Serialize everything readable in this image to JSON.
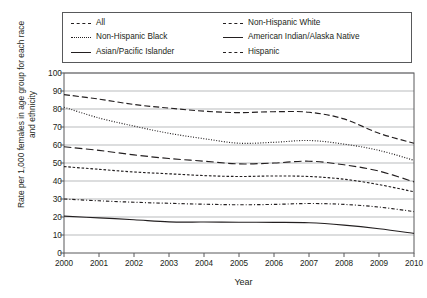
{
  "chart_data": {
    "type": "line",
    "title": "",
    "xlabel": "Year",
    "ylabel": "Rate per 1,000 females in age group for each race and ethnicity",
    "x": [
      2000,
      2001,
      2002,
      2003,
      2004,
      2005,
      2006,
      2007,
      2008,
      2009,
      2010
    ],
    "xlim": [
      2000,
      2010
    ],
    "ylim": [
      0,
      100
    ],
    "yticks": [
      0,
      10,
      20,
      30,
      40,
      50,
      60,
      70,
      80,
      90,
      100
    ],
    "xticks": [
      "2000",
      "2001",
      "2002",
      "2003",
      "2004",
      "2005",
      "2006",
      "2007",
      "2008",
      "2009",
      "2010"
    ],
    "grid": "horizontal",
    "legend_position": "top",
    "series": [
      {
        "name": "All",
        "dash": "long-dash",
        "values": [
          88.0,
          85.5,
          82.5,
          80.5,
          78.8,
          78.0,
          78.5,
          78.2,
          74.5,
          66.5,
          61.0
        ]
      },
      {
        "name": "Non-Hispanic Black",
        "dash": "dotted",
        "values": [
          81.0,
          75.0,
          70.5,
          66.5,
          63.5,
          61.0,
          61.5,
          62.5,
          60.5,
          57.0,
          51.5
        ]
      },
      {
        "name": "Asian/Pacific Islander",
        "dash": "solid",
        "values": [
          20.5,
          19.5,
          18.5,
          17.3,
          17.2,
          17.1,
          17.0,
          16.8,
          15.5,
          13.5,
          10.9
        ]
      },
      {
        "name": "Non-Hispanic White",
        "dash": "dash-dot",
        "values": [
          30.0,
          29.0,
          28.2,
          27.6,
          27.1,
          26.8,
          27.0,
          27.5,
          27.0,
          25.5,
          23.0
        ]
      },
      {
        "name": "American Indian/Alaska Native",
        "dash": "em-dash",
        "values": [
          59.0,
          57.0,
          54.5,
          52.5,
          51.0,
          49.5,
          50.0,
          51.0,
          49.0,
          45.5,
          39.5
        ]
      },
      {
        "name": "Hispanic",
        "dash": "short-dash",
        "values": [
          48.0,
          46.5,
          45.0,
          44.0,
          43.0,
          42.5,
          42.8,
          42.5,
          41.0,
          38.0,
          34.0
        ]
      }
    ]
  },
  "legend": {
    "items": [
      {
        "label": "All",
        "key": "all"
      },
      {
        "label": "Non-Hispanic White",
        "key": "nhwhite"
      },
      {
        "label": "Non-Hispanic Black",
        "key": "nhblack"
      },
      {
        "label": "American Indian/Alaska Native",
        "key": "aian"
      },
      {
        "label": "Asian/Pacific Islander",
        "key": "asian"
      },
      {
        "label": "Hispanic",
        "key": "hisp"
      }
    ]
  },
  "colors": {
    "line": "#231f20",
    "grid": "#a7a9ac",
    "axis": "#58595b",
    "background": "#ffffff"
  }
}
